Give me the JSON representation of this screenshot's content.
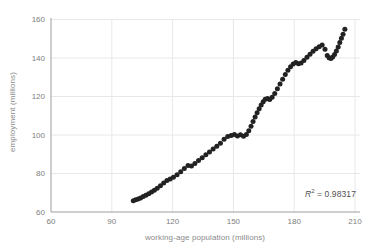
{
  "figure": {
    "background": "#ffffff"
  },
  "annotation": {
    "r_label": "R",
    "exponent": "2",
    "separator": " = ",
    "value": "0.98317"
  },
  "chart_data": {
    "type": "scatter",
    "title": "",
    "xlabel": "working-age population (millions)",
    "ylabel": "employment (millions)",
    "xlim": [
      60,
      210
    ],
    "ylim": [
      60,
      160
    ],
    "xticks": [
      60,
      90,
      120,
      150,
      180,
      210
    ],
    "yticks": [
      60,
      80,
      100,
      120,
      140,
      160
    ],
    "grid": true,
    "legend_position": "none",
    "annotation_text": "R² = 0.98317",
    "r_squared": 0.98317,
    "colors": {
      "point": "#222222",
      "grid": "#e8e8e8",
      "axis": "#9e9e9e",
      "tick_label": "#7e7e7e",
      "axis_title": "#8a8a8a",
      "annotation": "#4f4f4f"
    },
    "points": [
      [
        100.6,
        65.8
      ],
      [
        101.8,
        66.3
      ],
      [
        103.0,
        66.8
      ],
      [
        104.2,
        67.3
      ],
      [
        105.5,
        68.0
      ],
      [
        106.8,
        68.7
      ],
      [
        108.2,
        69.5
      ],
      [
        109.6,
        70.4
      ],
      [
        111.0,
        71.3
      ],
      [
        112.4,
        72.4
      ],
      [
        114.0,
        73.7
      ],
      [
        115.6,
        75.1
      ],
      [
        117.2,
        76.4
      ],
      [
        118.8,
        77.2
      ],
      [
        120.4,
        78.0
      ],
      [
        122.2,
        79.3
      ],
      [
        124.0,
        80.9
      ],
      [
        125.8,
        82.6
      ],
      [
        127.6,
        84.1
      ],
      [
        129.3,
        83.9
      ],
      [
        131.0,
        85.2
      ],
      [
        132.8,
        86.7
      ],
      [
        134.6,
        88.2
      ],
      [
        136.4,
        89.7
      ],
      [
        138.2,
        91.2
      ],
      [
        140.0,
        92.7
      ],
      [
        141.8,
        94.2
      ],
      [
        143.6,
        95.7
      ],
      [
        145.4,
        97.8
      ],
      [
        147.2,
        99.2
      ],
      [
        148.9,
        99.8
      ],
      [
        150.5,
        100.3
      ],
      [
        152.0,
        99.5
      ],
      [
        153.5,
        100.1
      ],
      [
        155.0,
        99.4
      ],
      [
        156.4,
        100.2
      ],
      [
        157.6,
        102.2
      ],
      [
        158.7,
        104.6
      ],
      [
        159.7,
        107.0
      ],
      [
        160.7,
        109.4
      ],
      [
        161.7,
        111.6
      ],
      [
        162.7,
        113.7
      ],
      [
        163.7,
        115.6
      ],
      [
        164.7,
        117.3
      ],
      [
        165.7,
        118.6
      ],
      [
        166.8,
        119.0
      ],
      [
        167.9,
        118.5
      ],
      [
        169.1,
        119.6
      ],
      [
        170.4,
        121.6
      ],
      [
        171.7,
        124.0
      ],
      [
        173.0,
        126.5
      ],
      [
        174.3,
        129.0
      ],
      [
        175.6,
        131.4
      ],
      [
        176.9,
        133.6
      ],
      [
        178.2,
        135.5
      ],
      [
        179.5,
        136.9
      ],
      [
        180.8,
        137.6
      ],
      [
        182.1,
        137.0
      ],
      [
        183.4,
        137.4
      ],
      [
        184.8,
        138.7
      ],
      [
        186.3,
        140.4
      ],
      [
        187.8,
        142.0
      ],
      [
        189.3,
        143.5
      ],
      [
        190.8,
        144.8
      ],
      [
        192.3,
        145.9
      ],
      [
        193.8,
        146.8
      ],
      [
        195.2,
        144.6
      ],
      [
        196.3,
        141.3
      ],
      [
        197.2,
        140.1
      ],
      [
        198.1,
        139.8
      ],
      [
        199.0,
        140.5
      ],
      [
        199.9,
        141.8
      ],
      [
        200.8,
        143.6
      ],
      [
        201.7,
        145.7
      ],
      [
        202.5,
        148.0
      ],
      [
        203.3,
        150.2
      ],
      [
        204.1,
        152.4
      ],
      [
        205.0,
        155.0
      ]
    ]
  }
}
